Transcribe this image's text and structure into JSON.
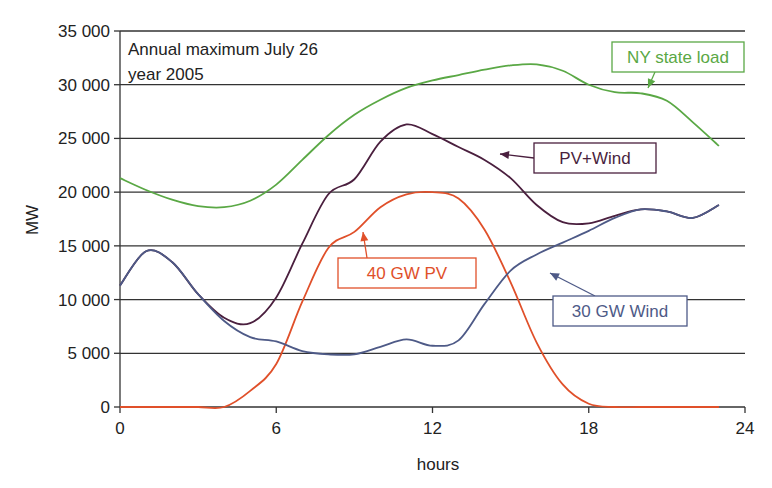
{
  "chart_data": {
    "type": "line",
    "title": "",
    "annotation": [
      "Annual maximum July 26",
      "year 2005"
    ],
    "xlabel": "hours",
    "ylabel": "MW",
    "xlim": [
      0,
      24
    ],
    "ylim": [
      0,
      35000
    ],
    "xticks": [
      0,
      6,
      12,
      18,
      24
    ],
    "xtick_labels": [
      "0",
      "6",
      "12",
      "18",
      "24"
    ],
    "yticks": [
      0,
      5000,
      10000,
      15000,
      20000,
      25000,
      30000,
      35000
    ],
    "ytick_labels": [
      "0",
      "5 000",
      "10 000",
      "15 000",
      "20 000",
      "25 000",
      "30 000",
      "35 000"
    ],
    "grid": "horizontal",
    "series": [
      {
        "name": "NY state load",
        "color": "#5aa845",
        "x": [
          0,
          1,
          2,
          3,
          4,
          5,
          6,
          7,
          8,
          9,
          10,
          11,
          12,
          13,
          14,
          15,
          16,
          17,
          18,
          19,
          20,
          21,
          22,
          23
        ],
        "values": [
          21300,
          20200,
          19300,
          18700,
          18600,
          19200,
          20700,
          23000,
          25300,
          27200,
          28600,
          29700,
          30400,
          30900,
          31400,
          31800,
          31900,
          31300,
          30000,
          29300,
          29200,
          28500,
          26500,
          24300
        ]
      },
      {
        "name": "PV+Wind",
        "color": "#4a1f3e",
        "x": [
          0,
          1,
          2,
          3,
          4,
          5,
          6,
          7,
          8,
          9,
          10,
          11,
          12,
          13,
          14,
          15,
          16,
          17,
          18,
          19,
          20,
          21,
          22,
          23
        ],
        "values": [
          11300,
          14500,
          13500,
          10500,
          8300,
          7800,
          10200,
          15200,
          19800,
          21200,
          24700,
          26300,
          25400,
          24200,
          23000,
          21300,
          18800,
          17200,
          17100,
          17800,
          18400,
          18200,
          17600,
          18800
        ]
      },
      {
        "name": "40 GW PV",
        "color": "#e0502a",
        "x": [
          0,
          1,
          2,
          3,
          4,
          5,
          6,
          7,
          8,
          9,
          10,
          11,
          12,
          13,
          14,
          15,
          16,
          17,
          18,
          19,
          20,
          21,
          22,
          23
        ],
        "values": [
          0,
          0,
          0,
          0,
          0,
          1500,
          4000,
          9800,
          14800,
          16300,
          18600,
          19800,
          20000,
          19400,
          16500,
          11600,
          6000,
          2100,
          300,
          0,
          0,
          0,
          0,
          0
        ]
      },
      {
        "name": "30 GW Wind",
        "color": "#4e5a87",
        "x": [
          0,
          1,
          2,
          3,
          4,
          5,
          6,
          7,
          8,
          9,
          10,
          11,
          12,
          13,
          14,
          15,
          16,
          17,
          18,
          19,
          20,
          21,
          22,
          23
        ],
        "values": [
          11300,
          14500,
          13500,
          10500,
          8000,
          6500,
          6100,
          5200,
          4900,
          4900,
          5600,
          6300,
          5700,
          6200,
          9600,
          12700,
          14200,
          15300,
          16400,
          17600,
          18400,
          18200,
          17600,
          18800
        ]
      }
    ],
    "labels": [
      {
        "text": "NY state load",
        "series": "NY state load"
      },
      {
        "text": "PV+Wind",
        "series": "PV+Wind"
      },
      {
        "text": "40 GW PV",
        "series": "40 GW PV"
      },
      {
        "text": "30 GW Wind",
        "series": "30 GW Wind"
      }
    ]
  }
}
